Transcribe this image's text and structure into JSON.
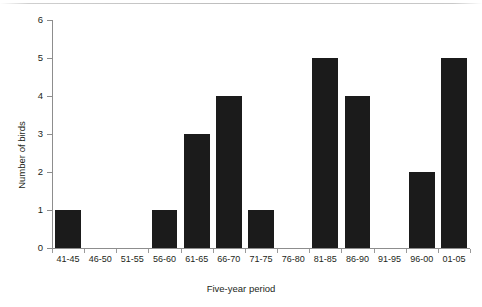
{
  "chart_data": {
    "type": "bar",
    "title": "",
    "xlabel": "Five-year period",
    "ylabel": "Number of birds",
    "categories": [
      "41-45",
      "46-50",
      "51-55",
      "56-60",
      "61-65",
      "66-70",
      "71-75",
      "76-80",
      "81-85",
      "86-90",
      "91-95",
      "96-00",
      "01-05"
    ],
    "values": [
      1,
      0,
      0,
      1,
      3,
      4,
      1,
      0,
      5,
      4,
      0,
      2,
      5
    ],
    "ylim": [
      0,
      6
    ],
    "yticks": [
      0,
      1,
      2,
      3,
      4,
      5,
      6
    ],
    "ytick_labels": [
      "0",
      "1",
      "2",
      "3",
      "4",
      "5",
      "6"
    ],
    "grid": false,
    "legend": null,
    "bar_color": "#1b1b1b",
    "axis_color": "#8d8d8d",
    "background": "#ffffff"
  }
}
